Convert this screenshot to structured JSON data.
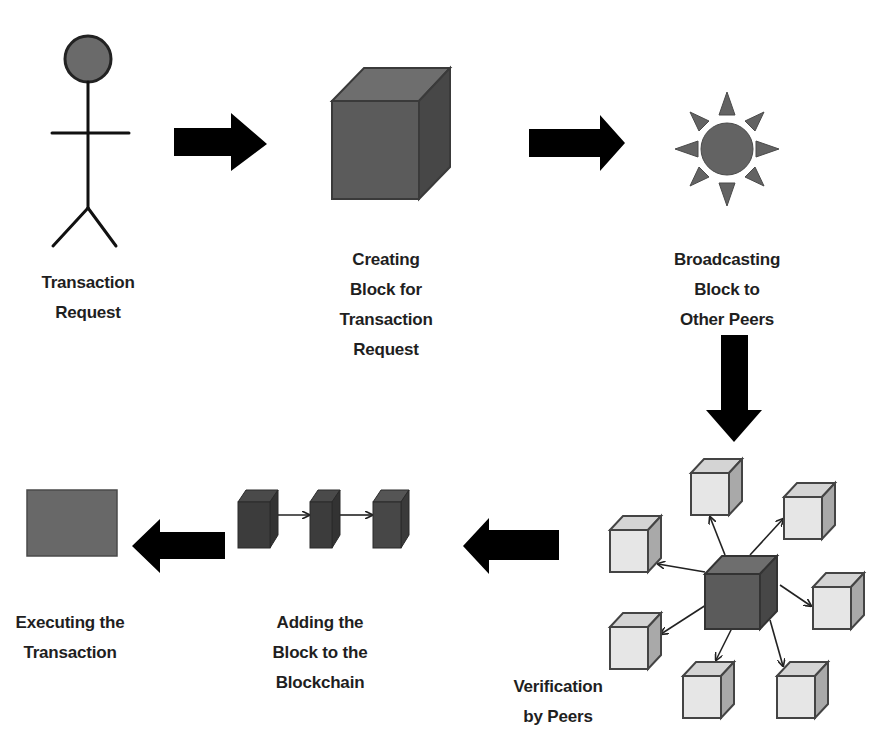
{
  "colors": {
    "background": "#ffffff",
    "ink": "#1f1f1f",
    "arrow": "#000000",
    "dark_block_front": "#5b5b5b",
    "dark_block_top": "#6e6e6e",
    "dark_block_side": "#474747",
    "chain_block": "#3c3c3c",
    "peer_block_front": "#e6e6e6",
    "peer_block_top": "#d4d4d4",
    "peer_block_side": "#a9a9a9",
    "sun": "#636363",
    "person_head": "#6a6a6a",
    "execute_box": "#686868"
  },
  "steps": [
    {
      "id": "transaction-request",
      "icon": "stick-figure-icon",
      "label_lines": [
        "Transaction",
        "Request"
      ]
    },
    {
      "id": "creating-block",
      "icon": "cube-icon",
      "label_lines": [
        "Creating",
        "Block for",
        "Transaction",
        "Request"
      ]
    },
    {
      "id": "broadcasting",
      "icon": "sun-broadcast-icon",
      "label_lines": [
        "Broadcasting",
        "Block to",
        "Other Peers"
      ]
    },
    {
      "id": "verification",
      "icon": "peer-network-icon",
      "label_lines": [
        "Verification",
        "by Peers"
      ]
    },
    {
      "id": "adding-block",
      "icon": "blockchain-icon",
      "label_lines": [
        "Adding the",
        "Block to the",
        "Blockchain"
      ]
    },
    {
      "id": "executing",
      "icon": "executed-box-icon",
      "label_lines": [
        "Executing the",
        "Transaction"
      ]
    }
  ],
  "flow_arrows": [
    {
      "from": "transaction-request",
      "to": "creating-block",
      "direction": "right"
    },
    {
      "from": "creating-block",
      "to": "broadcasting",
      "direction": "right"
    },
    {
      "from": "broadcasting",
      "to": "verification",
      "direction": "down"
    },
    {
      "from": "verification",
      "to": "adding-block",
      "direction": "left"
    },
    {
      "from": "adding-block",
      "to": "executing",
      "direction": "left"
    }
  ],
  "peer_network": {
    "center": "block",
    "peer_count": 7
  },
  "blockchain": {
    "block_count": 3
  }
}
